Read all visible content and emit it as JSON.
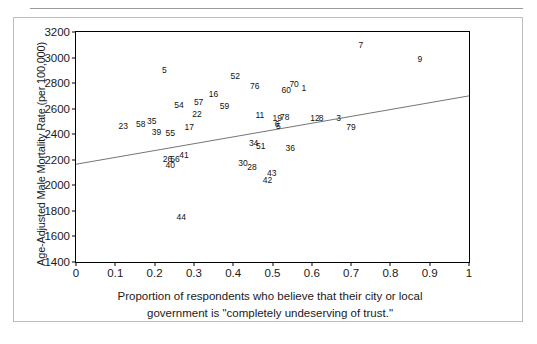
{
  "chart_data": {
    "type": "scatter",
    "title": "",
    "xlabel": "Proportion of respondents who believe that their city or local government is \"completely undeserving of trust.\"",
    "ylabel": "Age-Adjusted Male Mortality Rate (per 100,000)",
    "xlabel_line1": "Proportion of respondents who believe that their city or local",
    "xlabel_line2": "government is \"completely undeserving of trust.\"",
    "xlim": [
      0,
      1
    ],
    "ylim": [
      1400,
      3200
    ],
    "xticks": [
      "0",
      "0.1",
      "0.2",
      "0.3",
      "0.4",
      "0.5",
      "0.6",
      "0.7",
      "0.8",
      "0.9",
      "1"
    ],
    "xtick_values": [
      0,
      0.1,
      0.2,
      0.3,
      0.4,
      0.5,
      0.6,
      0.7,
      0.8,
      0.9,
      1
    ],
    "yticks": [
      "1400",
      "1600",
      "1800",
      "2000",
      "2200",
      "2400",
      "2600",
      "2800",
      "3000",
      "3200"
    ],
    "ytick_values": [
      1400,
      1600,
      1800,
      2000,
      2200,
      2400,
      2600,
      2800,
      3000,
      3200
    ],
    "grid": false,
    "legend": "none",
    "point_marker": "text-label",
    "trendline": {
      "name": "regression-line",
      "x": [
        0,
        1
      ],
      "y": [
        2165,
        2700
      ],
      "color": "#000000"
    },
    "points": [
      {
        "label": "5",
        "x": 0.225,
        "y": 2905
      },
      {
        "label": "52",
        "x": 0.405,
        "y": 2855
      },
      {
        "label": "7",
        "x": 0.725,
        "y": 3100
      },
      {
        "label": "9",
        "x": 0.875,
        "y": 2990
      },
      {
        "label": "76",
        "x": 0.455,
        "y": 2775
      },
      {
        "label": "70",
        "x": 0.555,
        "y": 2795
      },
      {
        "label": "1",
        "x": 0.58,
        "y": 2765
      },
      {
        "label": "60",
        "x": 0.535,
        "y": 2750
      },
      {
        "label": "16",
        "x": 0.35,
        "y": 2715
      },
      {
        "label": "57",
        "x": 0.312,
        "y": 2650
      },
      {
        "label": "54",
        "x": 0.262,
        "y": 2625
      },
      {
        "label": "59",
        "x": 0.378,
        "y": 2620
      },
      {
        "label": "22",
        "x": 0.308,
        "y": 2560
      },
      {
        "label": "11",
        "x": 0.468,
        "y": 2550
      },
      {
        "label": "19",
        "x": 0.512,
        "y": 2530
      },
      {
        "label": "78",
        "x": 0.531,
        "y": 2535
      },
      {
        "label": "12",
        "x": 0.608,
        "y": 2530
      },
      {
        "label": "8",
        "x": 0.624,
        "y": 2528
      },
      {
        "label": "3",
        "x": 0.668,
        "y": 2530
      },
      {
        "label": "35",
        "x": 0.193,
        "y": 2500
      },
      {
        "label": "58",
        "x": 0.165,
        "y": 2478
      },
      {
        "label": "23",
        "x": 0.12,
        "y": 2462
      },
      {
        "label": "6",
        "x": 0.512,
        "y": 2482
      },
      {
        "label": "5b",
        "x": 0.515,
        "y": 2468
      },
      {
        "label": "79",
        "x": 0.7,
        "y": 2460
      },
      {
        "label": "17",
        "x": 0.288,
        "y": 2455
      },
      {
        "label": "39",
        "x": 0.205,
        "y": 2420
      },
      {
        "label": "55",
        "x": 0.24,
        "y": 2408
      },
      {
        "label": "34",
        "x": 0.452,
        "y": 2335
      },
      {
        "label": "51",
        "x": 0.47,
        "y": 2310
      },
      {
        "label": "36",
        "x": 0.545,
        "y": 2290
      },
      {
        "label": "41",
        "x": 0.275,
        "y": 2235
      },
      {
        "label": "26",
        "x": 0.233,
        "y": 2205
      },
      {
        "label": "56",
        "x": 0.252,
        "y": 2208
      },
      {
        "label": "40",
        "x": 0.24,
        "y": 2160
      },
      {
        "label": "30",
        "x": 0.425,
        "y": 2175
      },
      {
        "label": "28",
        "x": 0.448,
        "y": 2145
      },
      {
        "label": "43",
        "x": 0.498,
        "y": 2100
      },
      {
        "label": "42",
        "x": 0.487,
        "y": 2040
      },
      {
        "label": "44",
        "x": 0.268,
        "y": 1755
      }
    ]
  },
  "figure": {
    "axis_color": "#000000",
    "border_color": "#bdbdbd",
    "background": "#ffffff"
  }
}
